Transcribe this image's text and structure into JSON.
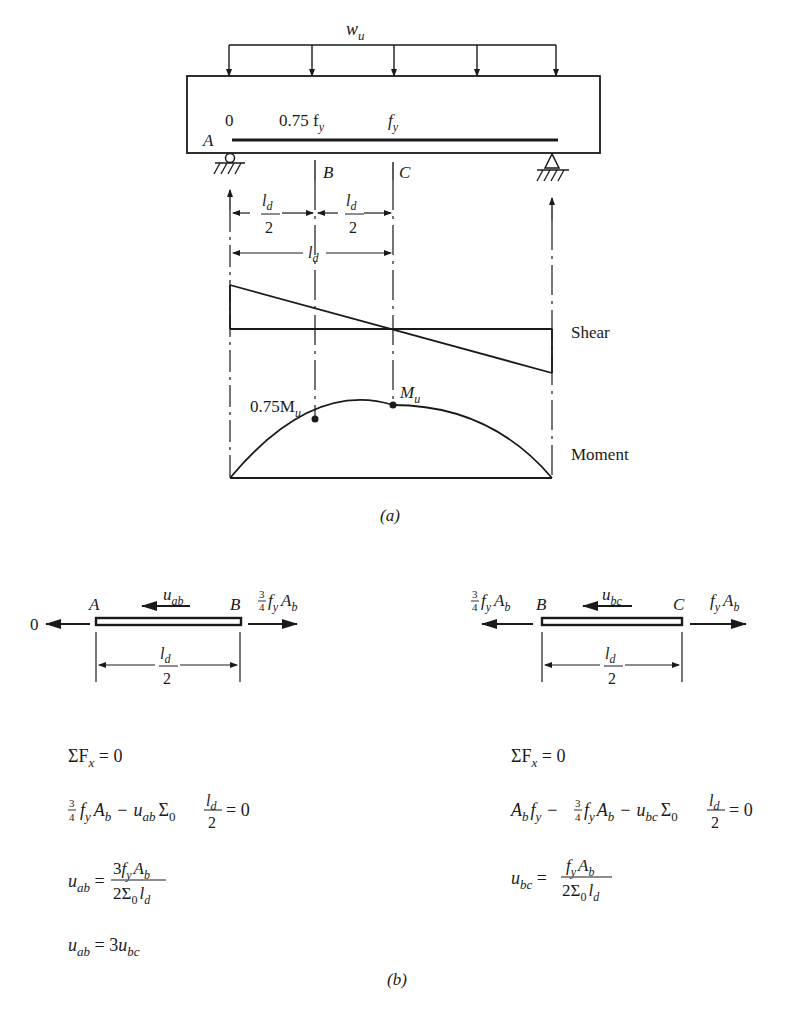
{
  "figure_a": {
    "load_label": "w",
    "load_sub": "u",
    "bar_stress_labels": [
      "0",
      "0.75 f",
      "f"
    ],
    "bar_stress_subs": [
      "",
      "y",
      "y"
    ],
    "points": {
      "A": "A",
      "B": "B",
      "C": "C"
    },
    "dim_half": {
      "num": "l",
      "sub": "d",
      "den": "2"
    },
    "dim_full": {
      "num": "l",
      "sub": "d"
    },
    "shear_label": "Shear",
    "moment_label": "Moment",
    "moment_points": [
      {
        "label": "0.75M",
        "sub": "u"
      },
      {
        "label": "M",
        "sub": "u"
      }
    ],
    "caption": "(a)"
  },
  "figure_b": {
    "left_fbd": {
      "left_force": "0",
      "point_left": "A",
      "point_right": "B",
      "bond": {
        "label": "u",
        "sub": "ab"
      },
      "right_force": {
        "frac_num": "3",
        "frac_den": "4",
        "text": "f",
        "sub": "y",
        "text2": "A",
        "sub2": "b"
      },
      "dim": {
        "num": "l",
        "sub": "d",
        "den": "2"
      }
    },
    "right_fbd": {
      "left_force": {
        "frac_num": "3",
        "frac_den": "4",
        "text": "f",
        "sub": "y",
        "text2": "A",
        "sub2": "b"
      },
      "point_left": "B",
      "point_right": "C",
      "bond": {
        "label": "u",
        "sub": "bc"
      },
      "right_force": {
        "text": "f",
        "sub": "y",
        "text2": "A",
        "sub2": "b"
      },
      "dim": {
        "num": "l",
        "sub": "d",
        "den": "2"
      }
    },
    "left_equations": [
      "ΣFx = 0",
      "3/4 fy Ab − uab Σ0 ld/2 = 0",
      "uab = 3fy Ab / (2Σ0 ld)",
      "uab = 3ubc"
    ],
    "right_equations": [
      "ΣFx = 0",
      "Ab fy − 3/4 fy Ab − ubc Σ0 ld/2 = 0",
      "ubc = fy Ab / (2Σ0 ld)"
    ],
    "caption": "(b)"
  }
}
